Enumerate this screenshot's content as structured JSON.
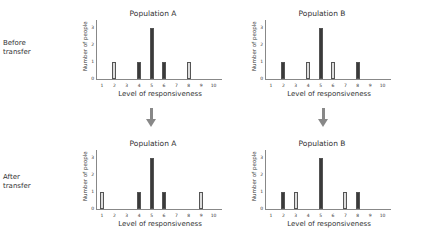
{
  "row_labels": {
    "before": [
      "Before",
      "transfer"
    ],
    "after": [
      "After",
      "transfer"
    ]
  },
  "chart_data": [
    {
      "type": "bar",
      "title": "Population A",
      "stage": "Before transfer",
      "xlabel": "Level of responsiveness",
      "ylabel": "Number of people",
      "categories": [
        "1",
        "2",
        "3",
        "4",
        "5",
        "6",
        "7",
        "8",
        "9",
        "10"
      ],
      "ylim": [
        0,
        3
      ],
      "yticks": [
        "0",
        "1",
        "2",
        "3"
      ],
      "series": [
        {
          "name": "dark",
          "color": "#3a3a3a",
          "values": [
            0,
            0,
            0,
            1,
            3,
            1,
            0,
            0,
            0,
            0
          ]
        },
        {
          "name": "light",
          "color": "#dddddd",
          "values": [
            0,
            1,
            0,
            0,
            0,
            0,
            0,
            1,
            0,
            0
          ]
        }
      ]
    },
    {
      "type": "bar",
      "title": "Population B",
      "stage": "Before transfer",
      "xlabel": "Level of responsiveness",
      "ylabel": "Number of people",
      "categories": [
        "1",
        "2",
        "3",
        "4",
        "5",
        "6",
        "7",
        "8",
        "9",
        "10"
      ],
      "ylim": [
        0,
        3
      ],
      "yticks": [
        "0",
        "1",
        "2",
        "3"
      ],
      "series": [
        {
          "name": "dark",
          "color": "#3a3a3a",
          "values": [
            0,
            1,
            0,
            0,
            3,
            0,
            0,
            1,
            0,
            0
          ]
        },
        {
          "name": "light",
          "color": "#dddddd",
          "values": [
            0,
            0,
            0,
            1,
            0,
            1,
            0,
            0,
            0,
            0
          ]
        }
      ]
    },
    {
      "type": "bar",
      "title": "Population A",
      "stage": "After transfer",
      "xlabel": "Level of responsiveness",
      "ylabel": "Number of people",
      "categories": [
        "1",
        "2",
        "3",
        "4",
        "5",
        "6",
        "7",
        "8",
        "9",
        "10"
      ],
      "ylim": [
        0,
        3
      ],
      "yticks": [
        "0",
        "1",
        "2",
        "3"
      ],
      "series": [
        {
          "name": "dark",
          "color": "#3a3a3a",
          "values": [
            0,
            0,
            0,
            1,
            3,
            1,
            0,
            0,
            0,
            0
          ]
        },
        {
          "name": "light",
          "color": "#dddddd",
          "values": [
            1,
            0,
            0,
            0,
            0,
            0,
            0,
            0,
            1,
            0
          ]
        }
      ]
    },
    {
      "type": "bar",
      "title": "Population B",
      "stage": "After transfer",
      "xlabel": "Level of responsiveness",
      "ylabel": "Number of people",
      "categories": [
        "1",
        "2",
        "3",
        "4",
        "5",
        "6",
        "7",
        "8",
        "9",
        "10"
      ],
      "ylim": [
        0,
        3
      ],
      "yticks": [
        "0",
        "1",
        "2",
        "3"
      ],
      "series": [
        {
          "name": "dark",
          "color": "#3a3a3a",
          "values": [
            0,
            1,
            0,
            0,
            3,
            0,
            0,
            1,
            0,
            0
          ]
        },
        {
          "name": "light",
          "color": "#dddddd",
          "values": [
            0,
            0,
            1,
            0,
            0,
            0,
            1,
            0,
            0,
            0
          ]
        }
      ]
    }
  ]
}
